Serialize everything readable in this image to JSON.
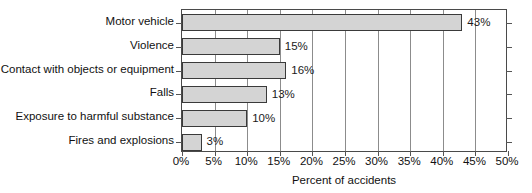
{
  "chart_data": {
    "type": "bar",
    "orientation": "horizontal",
    "title": "",
    "xlabel": "Percent of accidents",
    "ylabel": "",
    "categories": [
      "Motor vehicle",
      "Violence",
      "Contact with objects or equipment",
      "Falls",
      "Exposure to harmful substance",
      "Fires and explosions"
    ],
    "values": [
      43,
      15,
      16,
      13,
      10,
      3
    ],
    "value_labels": [
      "43%",
      "15%",
      "16%",
      "13%",
      "10%",
      "3%"
    ],
    "xlim": [
      0,
      50
    ],
    "xtick_values": [
      0,
      5,
      10,
      15,
      20,
      25,
      30,
      35,
      40,
      45,
      50
    ],
    "xtick_labels": [
      "0%",
      "5%",
      "10%",
      "15%",
      "20%",
      "25%",
      "30%",
      "35%",
      "40%",
      "45%",
      "50%"
    ],
    "grid": "vertical",
    "legend": "none",
    "colors": {
      "bar_fill": "#d4d4d4",
      "bar_border": "#3a3a3a",
      "gridline": "#8c8c8c",
      "axis": "#4a4a4a",
      "text": "#111111",
      "background": "#ffffff"
    }
  }
}
